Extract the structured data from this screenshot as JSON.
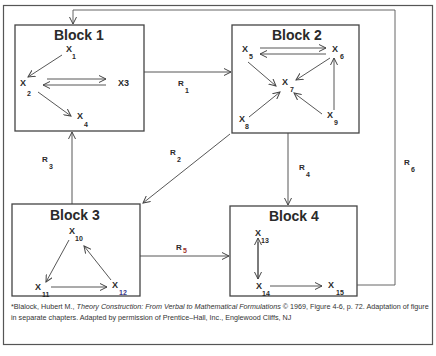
{
  "blocks": [
    {
      "id": "block-1",
      "title": "Block 1",
      "variables": [
        {
          "base": "X",
          "sub": "1"
        },
        {
          "base": "X",
          "sub": "2"
        },
        {
          "base": "X3",
          "sub": ""
        },
        {
          "base": "X",
          "sub": "4"
        }
      ]
    },
    {
      "id": "block-2",
      "title": "Block 2",
      "variables": [
        {
          "base": "X",
          "sub": "5"
        },
        {
          "base": "X",
          "sub": "6"
        },
        {
          "base": "X",
          "sub": "7"
        },
        {
          "base": "X",
          "sub": "8"
        },
        {
          "base": "X",
          "sub": "9"
        }
      ]
    },
    {
      "id": "block-3",
      "title": "Block 3",
      "variables": [
        {
          "base": "X",
          "sub": "10"
        },
        {
          "base": "X",
          "sub": "11"
        },
        {
          "base": "X",
          "sub": "12"
        }
      ]
    },
    {
      "id": "block-4",
      "title": "Block 4",
      "variables": [
        {
          "base": "X",
          "sub": "13"
        },
        {
          "base": "X",
          "sub": "14"
        },
        {
          "base": "X",
          "sub": "15"
        }
      ]
    }
  ],
  "relations": [
    {
      "base": "R",
      "sub": "1",
      "from": "Block 1",
      "to": "Block 2"
    },
    {
      "base": "R",
      "sub": "2",
      "from": "Block 2",
      "to": "Block 3"
    },
    {
      "base": "R",
      "sub": "3",
      "from": "Block 3",
      "to": "Block 1"
    },
    {
      "base": "R",
      "sub": "4",
      "from": "Block 2",
      "to": "Block 4"
    },
    {
      "base": "R",
      "sub": "5",
      "from": "Block 3",
      "to": "Block 4"
    },
    {
      "base": "R",
      "sub": "6",
      "from": "Block 4",
      "to": "Block 1"
    }
  ],
  "caption": {
    "prefix": "*Blalock, Hubert M., ",
    "title_italic": "Theory Construction:  From Verbal to Mathematical Formulations",
    "suffix": " © 1969, Figure 4-6, p. 72. Adaptation of figure in separate chapters. Adapted by permission of Prentice–Hall, Inc., Englewood Cliffs, NJ"
  },
  "colors": {
    "line": "#444444",
    "r5_sub": "#a0302a",
    "x12_sub": "#3a3a8a"
  }
}
